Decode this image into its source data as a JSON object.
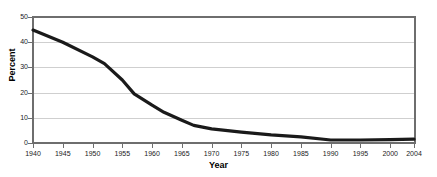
{
  "chart_data": {
    "type": "line",
    "title": "",
    "xlabel": "Year",
    "ylabel": "Percent",
    "xlim": [
      1940,
      2004
    ],
    "ylim": [
      0,
      50
    ],
    "grid": true,
    "legend": false,
    "xticks": [
      1940,
      1945,
      1950,
      1955,
      1960,
      1965,
      1970,
      1975,
      1980,
      1985,
      1990,
      1995,
      2000,
      2004
    ],
    "xtick_labels": [
      "1940",
      "1945",
      "1950",
      "1955",
      "1960",
      "1965",
      "1970",
      "1975",
      "1980",
      "1985",
      "1990",
      "1995",
      "2000",
      "2004"
    ],
    "yticks": [
      0,
      10,
      20,
      30,
      40,
      50
    ],
    "ytick_labels": [
      "0",
      "10",
      "20",
      "30",
      "40",
      "50"
    ],
    "line_color": "#1a1a1a",
    "grid_color": "#cfcfcf",
    "axis_color": "#6e6e6e",
    "series": [
      {
        "name": "Percent",
        "x": [
          1940,
          1945,
          1950,
          1952,
          1955,
          1957,
          1960,
          1962,
          1965,
          1967,
          1970,
          1975,
          1980,
          1985,
          1990,
          1995,
          2000,
          2004
        ],
        "values": [
          44.8,
          40.0,
          34.2,
          31.5,
          25.0,
          19.5,
          15.0,
          12.2,
          9.0,
          7.0,
          5.6,
          4.3,
          3.2,
          2.4,
          1.2,
          1.2,
          1.3,
          1.5
        ]
      }
    ]
  },
  "axis": {
    "y_title": "Percent",
    "x_title": "Year"
  }
}
